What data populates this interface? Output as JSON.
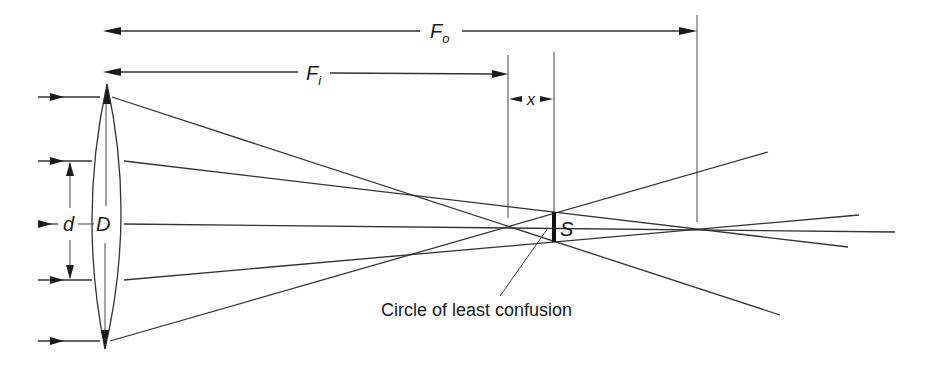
{
  "figure": {
    "labels": {
      "outer_focal_length": "F",
      "outer_focal_length_sub": "o",
      "inner_focal_length": "F",
      "inner_focal_length_sub": "i",
      "focal_separation": "x",
      "inner_aperture": "d",
      "lens_diameter": "D",
      "blur_spot": "S",
      "caption": "Circle of least confusion"
    },
    "elements": {
      "lens": "biconvex lens",
      "incoming_rays": 5,
      "marginal_focus": "F_i",
      "paraxial_focus": "F_o"
    },
    "colors": {
      "line": "#333333",
      "text": "#1a1a1a",
      "background": "#ffffff"
    }
  }
}
